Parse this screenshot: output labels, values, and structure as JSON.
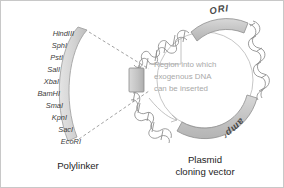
{
  "figure": {
    "background_color": "#ffffff",
    "border_color": "#c8c8c8"
  },
  "polylinker": {
    "caption": "Polylinker",
    "restriction_sites": [
      "HindIII",
      "SphI",
      "PstI",
      "SalI",
      "XbaI",
      "BamHI",
      "SmaI",
      "KpnI",
      "SacI",
      "EcoRI"
    ],
    "band_fill": "#dcdcdc",
    "band_stroke": "#9a9a9a",
    "label_color": "#3a3a3a"
  },
  "plasmid": {
    "caption_line1": "Plasmid",
    "caption_line2": "cloning vector",
    "ori_label": "ORI",
    "amp_label": "amp",
    "amp_superscript": "r",
    "inner_note_lines": [
      "Region into which",
      "exogenous DNA",
      "can  be inserted"
    ],
    "inner_note_color": "#a9a9a9",
    "arc_fill": "#c9c9c9",
    "arc_stroke": "#8f8f8f",
    "helix_stroke": "#8a8a8a",
    "insert_box_fill": "#c4c4c4",
    "insert_box_stroke": "#8a8a8a",
    "arrow_color": "#a0a0a0"
  },
  "connectors": {
    "dash_color": "#8a8a8a",
    "style": "dashed"
  }
}
